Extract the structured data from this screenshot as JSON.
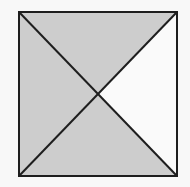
{
  "diagram": {
    "square": {
      "x1": 19,
      "y1": 12,
      "x2": 177,
      "y2": 176
    },
    "center": {
      "x": 98,
      "y": 95
    },
    "colors": {
      "background": "#f8f8f8",
      "shaded": "#cdcdcd",
      "unshaded": "#fafafa",
      "stroke": "#1e1e1e"
    },
    "triangles": [
      {
        "name": "top",
        "shaded": true
      },
      {
        "name": "left",
        "shaded": true
      },
      {
        "name": "bottom",
        "shaded": true
      },
      {
        "name": "right",
        "shaded": false
      }
    ],
    "stroke_width": 2
  }
}
